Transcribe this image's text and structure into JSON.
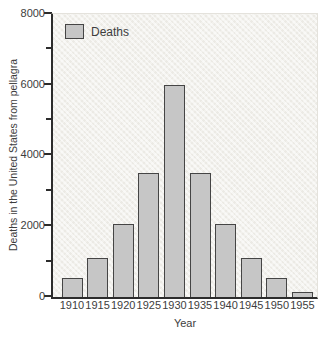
{
  "figure": {
    "legend_label": "Deaths",
    "y_axis_title": "Deaths in the United States from pellagra",
    "x_axis_title": "Year"
  },
  "chart_data": {
    "type": "bar",
    "title": "",
    "categories": [
      "1910",
      "1915",
      "1920",
      "1925",
      "1930",
      "1935",
      "1940",
      "1945",
      "1950",
      "1955"
    ],
    "values": [
      550,
      1100,
      2050,
      3500,
      6000,
      3500,
      2050,
      1100,
      550,
      150
    ],
    "series_name": "Deaths",
    "xlabel": "Year",
    "ylabel": "Deaths in the United States from pellagra",
    "ylim": [
      0,
      8000
    ],
    "y_ticks": [
      0,
      1000,
      2000,
      3000,
      4000,
      5000,
      6000,
      7000,
      8000
    ],
    "y_labeled_ticks": [
      0,
      2000,
      4000,
      6000,
      8000
    ],
    "grid": false,
    "legend_position": "top-left",
    "bar_fill_color": "#c6c6c6",
    "bar_border_color": "#454545",
    "plot_background_color": "#f2f1ed",
    "axis_color": "#2c2c2c",
    "text_color": "#3d3d3d"
  }
}
